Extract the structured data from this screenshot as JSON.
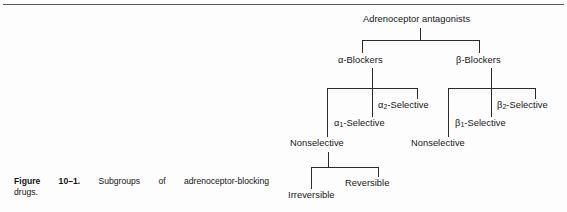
{
  "page": {
    "background_color": "#fdfdfd",
    "rule_color": "#5a5a5a",
    "line_color": "#2b2b2b",
    "text_color": "#161616"
  },
  "caption": {
    "figure_label": "Figure 10–1.",
    "line1_text": "Subgroups of adrenoceptor-blocking",
    "line2_text": "drugs."
  },
  "diagram": {
    "type": "tree",
    "root": "Adrenoceptor antagonists",
    "nodes": {
      "root": "Adrenoceptor antagonists",
      "alpha_blockers": "α-Blockers",
      "beta_blockers": "β-Blockers",
      "alpha1_selective_prefix": "α",
      "alpha1_selective_sub": "1",
      "alpha1_selective_suffix": "-Selective",
      "alpha2_selective_prefix": "α",
      "alpha2_selective_sub": "2",
      "alpha2_selective_suffix": "-Selective",
      "beta1_selective_prefix": "β",
      "beta1_selective_sub": "1",
      "beta1_selective_suffix": "-Selective",
      "beta2_selective_prefix": "β",
      "beta2_selective_sub": "2",
      "beta2_selective_suffix": "-Selective",
      "alpha_nonselective": "Nonselective",
      "beta_nonselective": "Nonselective",
      "irreversible": "Irreversible",
      "reversible": "Reversible"
    },
    "edges": [
      {
        "from": "Adrenoceptor antagonists",
        "to": "α-Blockers"
      },
      {
        "from": "Adrenoceptor antagonists",
        "to": "β-Blockers"
      },
      {
        "from": "α-Blockers",
        "to": "Nonselective"
      },
      {
        "from": "α-Blockers",
        "to": "α1-Selective"
      },
      {
        "from": "α-Blockers",
        "to": "α2-Selective"
      },
      {
        "from": "β-Blockers",
        "to": "Nonselective"
      },
      {
        "from": "β-Blockers",
        "to": "β1-Selective"
      },
      {
        "from": "β-Blockers",
        "to": "β2-Selective"
      },
      {
        "from": "Nonselective",
        "to": "Irreversible"
      },
      {
        "from": "Nonselective",
        "to": "Reversible"
      }
    ]
  }
}
